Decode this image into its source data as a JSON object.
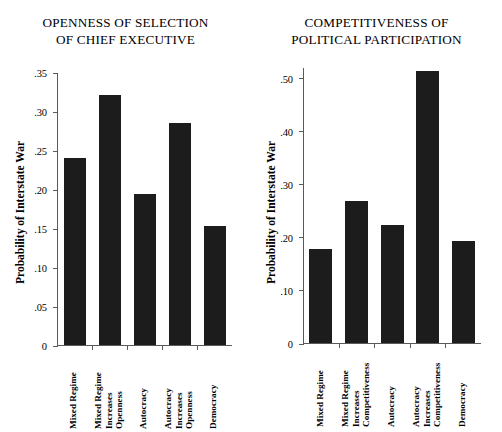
{
  "figure": {
    "ylabel": "Probability of Interstate War"
  },
  "chart_data": [
    {
      "type": "bar",
      "title": "OPENNESS OF SELECTION OF CHIEF EXECUTIVE",
      "title_lines": [
        "OPENNESS OF SELECTION",
        "OF CHIEF EXECUTIVE"
      ],
      "xlabel": "",
      "ylabel": "Probability of Interstate War",
      "ylim": [
        0,
        0.35
      ],
      "yticks": [
        0,
        0.05,
        0.1,
        0.15,
        0.2,
        0.25,
        0.3,
        0.35
      ],
      "ytick_labels": [
        "0",
        ".05",
        ".10",
        ".15",
        ".20",
        ".25",
        ".30",
        ".35"
      ],
      "grid": false,
      "legend": "none",
      "categories": [
        "Mixed Regime",
        "Mixed Regime Increases Openness",
        "Autocracy",
        "Autocracy Increases Openness",
        "Democracy"
      ],
      "category_lines": [
        [
          "Mixed Regime"
        ],
        [
          "Mixed Regime",
          "Increases",
          "Openness"
        ],
        [
          "Autocracy"
        ],
        [
          "Autocracy",
          "Increases",
          "Openness"
        ],
        [
          "Democracy"
        ]
      ],
      "values": [
        0.24,
        0.32,
        0.194,
        0.285,
        0.152
      ]
    },
    {
      "type": "bar",
      "title": "COMPETITIVENESS OF POLITICAL PARTICIPATION",
      "title_lines": [
        "COMPETITIVENESS OF",
        "POLITICAL PARTICIPATION"
      ],
      "xlabel": "",
      "ylabel": "Probability of Interstate War",
      "ylim": [
        0,
        0.52
      ],
      "yticks": [
        0,
        0.1,
        0.2,
        0.3,
        0.4,
        0.5
      ],
      "ytick_labels": [
        "0",
        ".10",
        ".20",
        ".30",
        ".40",
        ".50"
      ],
      "grid": false,
      "legend": "none",
      "categories": [
        "Mixed Regime",
        "Mixed Regime Increases Competitiveness",
        "Autocracy",
        "Autocracy Increases Competitiveness",
        "Democracy"
      ],
      "category_lines": [
        [
          "Mixed Regime"
        ],
        [
          "Mixed Regime",
          "Increases",
          "Competitiveness"
        ],
        [
          "Autocracy"
        ],
        [
          "Autocracy",
          "Increases",
          "Competitiveness"
        ],
        [
          "Democracy"
        ]
      ],
      "values": [
        0.177,
        0.268,
        0.222,
        0.512,
        0.193
      ]
    }
  ],
  "colors": {
    "bar": "#1c1c1c",
    "axis": "#5a5a5a",
    "background": "#ffffff",
    "text": "#000000"
  }
}
